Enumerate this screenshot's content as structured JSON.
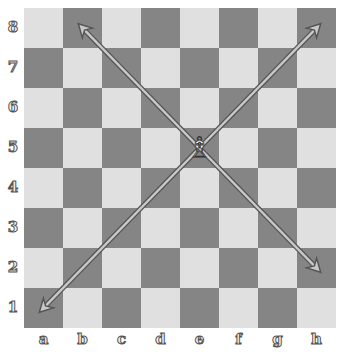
{
  "board": {
    "files": [
      "a",
      "b",
      "c",
      "d",
      "e",
      "f",
      "g",
      "h"
    ],
    "ranks": [
      "8",
      "7",
      "6",
      "5",
      "4",
      "3",
      "2",
      "1"
    ],
    "light_color": "#e0e0e0",
    "dark_color": "#858585"
  },
  "pieces": [
    {
      "square": "e5",
      "piece": "white-bishop",
      "glyph": "♗"
    }
  ],
  "arrows": [
    {
      "from": "e5",
      "to": "b8"
    },
    {
      "from": "e5",
      "to": "h8"
    },
    {
      "from": "e5",
      "to": "a1"
    },
    {
      "from": "e5",
      "to": "h2"
    }
  ]
}
